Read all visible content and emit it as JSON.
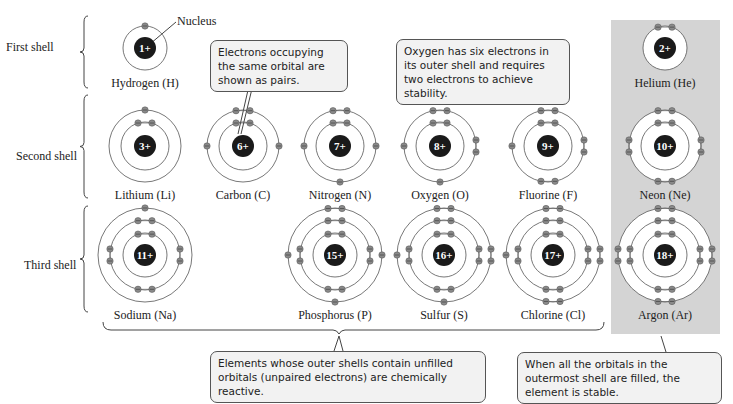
{
  "shell_labels": {
    "first": "First shell",
    "second": "Second shell",
    "third": "Third shell"
  },
  "nucleus_label": "Nucleus",
  "atoms": [
    {
      "name": "Hydrogen (H)",
      "charge": "1+",
      "cx": 145,
      "cy": 48,
      "shells": [
        1
      ],
      "noble": false
    },
    {
      "name": "Helium (He)",
      "charge": "2+",
      "cx": 665,
      "cy": 48,
      "shells": [
        2
      ],
      "noble": true
    },
    {
      "name": "Lithium (Li)",
      "charge": "3+",
      "cx": 145,
      "cy": 146,
      "shells": [
        2,
        1
      ],
      "noble": false
    },
    {
      "name": "Carbon (C)",
      "charge": "6+",
      "cx": 243,
      "cy": 146,
      "shells": [
        2,
        4
      ],
      "noble": false
    },
    {
      "name": "Nitrogen (N)",
      "charge": "7+",
      "cx": 340,
      "cy": 146,
      "shells": [
        2,
        5
      ],
      "noble": false
    },
    {
      "name": "Oxygen (O)",
      "charge": "8+",
      "cx": 440,
      "cy": 146,
      "shells": [
        2,
        6
      ],
      "noble": false
    },
    {
      "name": "Fluorine (F)",
      "charge": "9+",
      "cx": 548,
      "cy": 146,
      "shells": [
        2,
        7
      ],
      "noble": false
    },
    {
      "name": "Neon (Ne)",
      "charge": "10+",
      "cx": 665,
      "cy": 146,
      "shells": [
        2,
        8
      ],
      "noble": true
    },
    {
      "name": "Sodium (Na)",
      "charge": "11+",
      "cx": 145,
      "cy": 255,
      "shells": [
        2,
        8,
        1
      ],
      "noble": false
    },
    {
      "name": "Phosphorus (P)",
      "charge": "15+",
      "cx": 335,
      "cy": 255,
      "shells": [
        2,
        8,
        5
      ],
      "noble": false
    },
    {
      "name": "Sulfur (S)",
      "charge": "16+",
      "cx": 444,
      "cy": 255,
      "shells": [
        2,
        8,
        6
      ],
      "noble": false
    },
    {
      "name": "Chlorine (Cl)",
      "charge": "17+",
      "cx": 553,
      "cy": 255,
      "shells": [
        2,
        8,
        7
      ],
      "noble": false
    },
    {
      "name": "Argon (Ar)",
      "charge": "18+",
      "cx": 665,
      "cy": 255,
      "shells": [
        2,
        8,
        8
      ],
      "noble": true
    }
  ],
  "callouts": {
    "pairs": "Electrons occupying the same orbital are shown as pairs.",
    "oxygen": "Oxygen has six electrons in its outer shell and requires two electrons to achieve stability.",
    "reactive": "Elements whose outer shells contain unfilled orbitals (unpaired electrons) are chemically reactive.",
    "stable": "When all the orbitals in the outermost shell are filled, the element is stable."
  },
  "colors": {
    "nucleus": "#1a1a1a",
    "electron": "#8a8a8a",
    "orbit": "#555555",
    "noble_panel": "#d4d4d4",
    "callout_bg": "#f2f2f2"
  }
}
